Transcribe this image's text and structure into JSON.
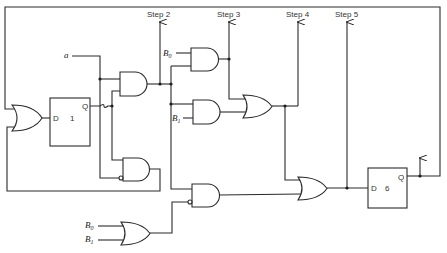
{
  "diagram": {
    "type": "logic-circuit",
    "step_outputs": [
      {
        "label": "Step 2"
      },
      {
        "label": "Step 3"
      },
      {
        "label": "Step 4"
      },
      {
        "label": "Step 5"
      }
    ],
    "inputs": {
      "a": "a",
      "b0_top": {
        "letter": "B",
        "sub": "0"
      },
      "b1_mid": {
        "letter": "B",
        "sub": "1"
      },
      "b0_bottom": {
        "letter": "B",
        "sub": "0"
      },
      "b1_bottom": {
        "letter": "B",
        "sub": "1"
      }
    },
    "flipflops": [
      {
        "d_label": "D",
        "q_label": "Q",
        "number": "1"
      },
      {
        "d_label": "D",
        "q_label": "Q",
        "number": "6"
      }
    ],
    "colors": {
      "line": "#2a2a2a",
      "background": "#ffffff"
    }
  }
}
